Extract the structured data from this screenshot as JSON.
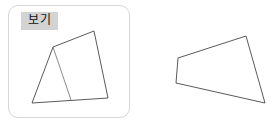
{
  "page": {
    "background_color": "#ffffff",
    "width": 275,
    "height": 128
  },
  "example_card": {
    "label": "보기",
    "label_background_color": "#d3d3d3",
    "border_color": "#d6d6d6",
    "background_color": "#ffffff"
  },
  "figures": {
    "stroke_color": "#5a5a5a",
    "inner_line_color": "#8a8a8a",
    "left": {
      "name": "quadrilateral-with-internal-segment",
      "outline_points": "32,103 53,47 94,31 108,98",
      "internal_segment": "53,47 71,100",
      "vertex_count": 4
    },
    "right": {
      "name": "quadrilateral",
      "outline_points": "178,58 246,36 265,103 176,83",
      "vertex_count": 4
    }
  }
}
